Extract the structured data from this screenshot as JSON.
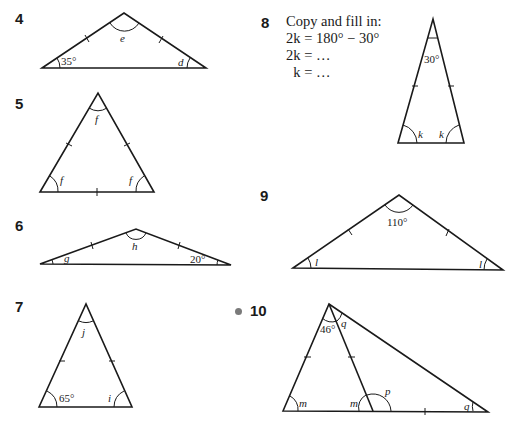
{
  "questions": [
    {
      "number": "4",
      "angles": {
        "apex": "e",
        "base_left": "35°",
        "base_right": "d"
      }
    },
    {
      "number": "5",
      "angles": {
        "apex": "f",
        "base_left": "f",
        "base_right": "f"
      }
    },
    {
      "number": "6",
      "angles": {
        "apex": "h",
        "base_left": "g",
        "base_right": "20°"
      }
    },
    {
      "number": "7",
      "angles": {
        "apex": "j",
        "base_left": "65°",
        "base_right": "i"
      }
    },
    {
      "number": "8",
      "instructions": [
        "Copy and fill in:",
        "2k = 180° − 30°",
        "2k = …",
        "  k = …"
      ],
      "angles": {
        "apex": "30°",
        "base_left": "k",
        "base_right": "k"
      }
    },
    {
      "number": "9",
      "angles": {
        "apex": "110°",
        "base_left": "l",
        "base_right": "l"
      }
    },
    {
      "number": "10",
      "bullet": true,
      "angles": {
        "apex_left": "46°",
        "apex_right": "q",
        "base_left": "m",
        "inner_base": "m",
        "exterior": "p",
        "base_right": "q"
      }
    }
  ]
}
